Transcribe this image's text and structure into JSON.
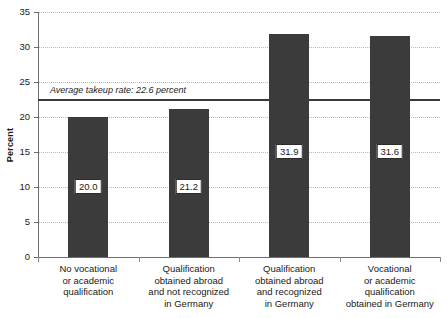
{
  "chart_data": {
    "type": "bar",
    "title": "",
    "xlabel": "",
    "ylabel": "Percent",
    "ylim": [
      0,
      35
    ],
    "yticks": [
      0,
      5,
      10,
      15,
      20,
      25,
      30,
      35
    ],
    "ytick_labels": [
      "0",
      "5",
      "10",
      "15",
      "20",
      "25",
      "30",
      "35"
    ],
    "grid": true,
    "legend": "none",
    "categories": [
      "No vocational\nor academic\nqualification",
      "Qualification\nobtained abroad\nand not recognized\nin Germany",
      "Qualification\nobtained abroad\nand recognized\nin Germany",
      "Vocational\nor academic\nqualification\nobtained in Germany"
    ],
    "values": [
      20.0,
      21.2,
      31.9,
      31.6
    ],
    "value_labels": [
      "20.0",
      "21.2",
      "31.9",
      "31.6"
    ],
    "annotations": [
      {
        "name": "average-takeup-line",
        "text": "Average takeup rate: 22.6 percent",
        "value": 22.6,
        "style": "horizontal reference line with italic label above"
      }
    ],
    "colors": {
      "bar_fill": "#3b3b3b",
      "average_line": "#3b3b3b",
      "gridline": "#b9b9b9",
      "axis": "#6e6e6e",
      "background": "#ffffff",
      "text": "#1a1a1a"
    }
  }
}
